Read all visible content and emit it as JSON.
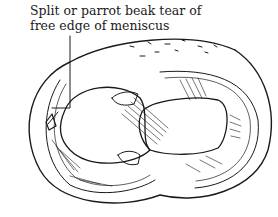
{
  "figure": {
    "subject": "meniscus",
    "annotation": {
      "line1": "Split or parrot beak tear of",
      "line2": "free edge of meniscus"
    },
    "colors": {
      "ink": "#1a1a1a",
      "background": "#ffffff"
    }
  }
}
